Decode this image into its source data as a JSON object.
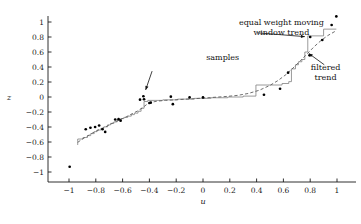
{
  "chart_data": {
    "type": "scatter",
    "title": "",
    "xlabel": "u",
    "ylabel": "z",
    "xlim": [
      -1.08,
      1.08
    ],
    "ylim": [
      -1.08,
      1.12
    ],
    "grid": false,
    "legend_position": "none",
    "xticks": [
      -1,
      -0.8,
      -0.6,
      -0.4,
      -0.2,
      0,
      0.2,
      0.4,
      0.6,
      0.8,
      1
    ],
    "xticklabels": [
      "−1",
      "−0.8",
      "−0.6",
      "−0.4",
      "−0.2",
      "0",
      "0.2",
      "0.4",
      "0.6",
      "0.8",
      "1"
    ],
    "yticks": [
      1,
      0.8,
      0.6,
      0.4,
      0.2,
      0,
      -0.2,
      -0.4,
      -0.6,
      -0.8,
      -1
    ],
    "yticklabels": [
      "1",
      "0.8",
      "0.6",
      "0.4",
      "0.2",
      "0",
      "−0.2",
      "−0.4",
      "−0.6",
      "−0.8",
      "−1"
    ],
    "series": [
      {
        "name": "samples",
        "type": "scatter",
        "marker": "dot",
        "color": "#000000",
        "points": [
          [
            -0.995,
            -0.93
          ],
          [
            -0.875,
            -0.43
          ],
          [
            -0.84,
            -0.41
          ],
          [
            -0.805,
            -0.4
          ],
          [
            -0.775,
            -0.38
          ],
          [
            -0.75,
            -0.43
          ],
          [
            -0.73,
            -0.465
          ],
          [
            -0.655,
            -0.3
          ],
          [
            -0.63,
            -0.295
          ],
          [
            -0.615,
            -0.315
          ],
          [
            -0.47,
            -0.035
          ],
          [
            -0.445,
            0.01
          ],
          [
            -0.44,
            -0.03
          ],
          [
            -0.4,
            -0.08
          ],
          [
            -0.39,
            -0.075
          ],
          [
            -0.24,
            0.005
          ],
          [
            -0.225,
            -0.095
          ],
          [
            -0.1,
            -0.005
          ],
          [
            0.0,
            -0.005
          ],
          [
            0.455,
            0.03
          ],
          [
            0.575,
            0.11
          ],
          [
            0.635,
            0.325
          ],
          [
            0.795,
            0.555
          ],
          [
            0.8,
            0.8
          ],
          [
            0.89,
            0.76
          ],
          [
            0.96,
            0.96
          ],
          [
            0.995,
            1.075
          ]
        ]
      },
      {
        "name": "equal weight moving window trend",
        "type": "step",
        "color": "#808080",
        "points": [
          [
            -0.935,
            -0.64
          ],
          [
            -0.935,
            -0.56
          ],
          [
            -0.895,
            -0.56
          ],
          [
            -0.895,
            -0.54
          ],
          [
            -0.862,
            -0.54
          ],
          [
            -0.862,
            -0.515
          ],
          [
            -0.838,
            -0.515
          ],
          [
            -0.838,
            -0.488
          ],
          [
            -0.812,
            -0.488
          ],
          [
            -0.812,
            -0.462
          ],
          [
            -0.79,
            -0.462
          ],
          [
            -0.79,
            -0.44
          ],
          [
            -0.762,
            -0.44
          ],
          [
            -0.762,
            -0.418
          ],
          [
            -0.74,
            -0.418
          ],
          [
            -0.74,
            -0.398
          ],
          [
            -0.712,
            -0.398
          ],
          [
            -0.712,
            -0.372
          ],
          [
            -0.69,
            -0.372
          ],
          [
            -0.69,
            -0.352
          ],
          [
            -0.665,
            -0.352
          ],
          [
            -0.665,
            -0.332
          ],
          [
            -0.64,
            -0.332
          ],
          [
            -0.64,
            -0.312
          ],
          [
            -0.615,
            -0.312
          ],
          [
            -0.615,
            -0.288
          ],
          [
            -0.59,
            -0.288
          ],
          [
            -0.59,
            -0.272
          ],
          [
            -0.562,
            -0.272
          ],
          [
            -0.562,
            -0.255
          ],
          [
            -0.535,
            -0.255
          ],
          [
            -0.535,
            -0.235
          ],
          [
            -0.512,
            -0.235
          ],
          [
            -0.512,
            -0.215
          ],
          [
            -0.485,
            -0.215
          ],
          [
            -0.485,
            -0.19
          ],
          [
            -0.462,
            -0.19
          ],
          [
            -0.462,
            -0.15
          ],
          [
            -0.44,
            -0.15
          ],
          [
            -0.44,
            -0.06
          ],
          [
            -0.412,
            -0.06
          ],
          [
            -0.412,
            -0.045
          ],
          [
            -0.3,
            -0.045
          ],
          [
            -0.3,
            -0.038
          ],
          [
            -0.19,
            -0.038
          ],
          [
            -0.19,
            -0.028
          ],
          [
            -0.065,
            -0.028
          ],
          [
            -0.065,
            -0.018
          ],
          [
            0.06,
            -0.018
          ],
          [
            0.06,
            -0.01
          ],
          [
            0.185,
            -0.01
          ],
          [
            0.185,
            0.0
          ],
          [
            0.3,
            0.0
          ],
          [
            0.3,
            0.012
          ],
          [
            0.395,
            0.012
          ],
          [
            0.395,
            0.16
          ],
          [
            0.59,
            0.16
          ],
          [
            0.59,
            0.18
          ],
          [
            0.64,
            0.18
          ],
          [
            0.64,
            0.205
          ],
          [
            0.66,
            0.205
          ],
          [
            0.66,
            0.375
          ],
          [
            0.69,
            0.375
          ],
          [
            0.69,
            0.43
          ],
          [
            0.712,
            0.43
          ],
          [
            0.712,
            0.47
          ],
          [
            0.738,
            0.47
          ],
          [
            0.738,
            0.5
          ],
          [
            0.76,
            0.5
          ],
          [
            0.76,
            0.6
          ],
          [
            0.782,
            0.6
          ],
          [
            0.782,
            0.815
          ],
          [
            0.9,
            0.815
          ],
          [
            0.9,
            0.905
          ],
          [
            0.995,
            0.905
          ]
        ]
      },
      {
        "name": "filtered trend",
        "type": "line",
        "style": "dashed",
        "color": "#555555",
        "points": [
          [
            -0.935,
            -0.605
          ],
          [
            -0.9,
            -0.56
          ],
          [
            -0.862,
            -0.52
          ],
          [
            -0.825,
            -0.48
          ],
          [
            -0.79,
            -0.448
          ],
          [
            -0.752,
            -0.418
          ],
          [
            -0.715,
            -0.388
          ],
          [
            -0.678,
            -0.352
          ],
          [
            -0.64,
            -0.318
          ],
          [
            -0.602,
            -0.288
          ],
          [
            -0.565,
            -0.258
          ],
          [
            -0.528,
            -0.222
          ],
          [
            -0.49,
            -0.188
          ],
          [
            -0.455,
            -0.148
          ],
          [
            -0.42,
            -0.1
          ],
          [
            -0.385,
            -0.07
          ],
          [
            -0.34,
            -0.055
          ],
          [
            -0.28,
            -0.045
          ],
          [
            -0.21,
            -0.038
          ],
          [
            -0.14,
            -0.03
          ],
          [
            -0.06,
            -0.022
          ],
          [
            0.02,
            -0.012
          ],
          [
            0.1,
            -0.002
          ],
          [
            0.18,
            0.008
          ],
          [
            0.26,
            0.022
          ],
          [
            0.34,
            0.048
          ],
          [
            0.42,
            0.09
          ],
          [
            0.5,
            0.155
          ],
          [
            0.56,
            0.22
          ],
          [
            0.62,
            0.3
          ],
          [
            0.68,
            0.4
          ],
          [
            0.73,
            0.49
          ],
          [
            0.78,
            0.58
          ],
          [
            0.83,
            0.672
          ],
          [
            0.88,
            0.752
          ],
          [
            0.93,
            0.818
          ],
          [
            0.995,
            0.885
          ]
        ]
      }
    ],
    "annotations": [
      {
        "name": "samples",
        "lines": [
          "samples"
        ],
        "text_x": 0.147,
        "text_y": 0.495,
        "arrow_from": [
          -0.38,
          0.345
        ],
        "arrow_to": [
          -0.428,
          0.095
        ]
      },
      {
        "name": "equal weight moving window trend",
        "lines": [
          "equal weight moving",
          "window trend"
        ],
        "text_x": 0.585,
        "text_y": 0.955,
        "arrow_from": [
          0.41,
          0.855
        ],
        "arrow_to": [
          0.76,
          0.805
        ]
      },
      {
        "name": "filtered trend",
        "lines": [
          "filtered",
          "trend"
        ],
        "text_x": 0.915,
        "text_y": 0.36,
        "arrow_from": [
          0.905,
          0.43
        ],
        "arrow_to": [
          0.79,
          0.58
        ]
      }
    ]
  },
  "colors": {
    "axis": "#1a1a1a",
    "samples": "#000000",
    "step_trend": "#808080",
    "filtered_trend": "#555555",
    "background": "#ffffff"
  }
}
